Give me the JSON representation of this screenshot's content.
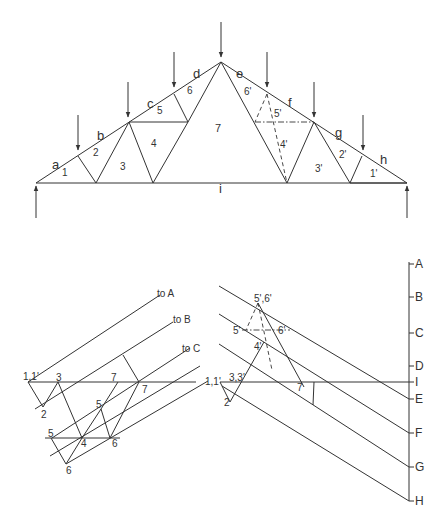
{
  "diagram": {
    "colors": {
      "line": "#333333",
      "background": "#ffffff"
    },
    "truss": {
      "lines": [
        [
          36,
          183,
          221,
          62
        ],
        [
          221,
          62,
          407,
          183
        ],
        [
          36,
          183,
          407,
          183
        ],
        [
          78,
          156,
          96,
          183
        ],
        [
          96,
          183,
          129,
          122
        ],
        [
          129,
          122,
          153,
          183
        ],
        [
          129,
          122,
          188,
          122
        ],
        [
          153,
          183,
          188,
          122
        ],
        [
          174,
          94,
          188,
          122
        ],
        [
          188,
          122,
          221,
          62
        ],
        [
          221,
          62,
          287,
          183
        ],
        [
          287,
          183,
          314,
          122
        ],
        [
          314,
          122,
          350,
          183
        ],
        [
          350,
          183,
          362,
          156
        ],
        [
          350,
          183,
          407,
          183
        ]
      ],
      "dashed": [
        [
          267,
          94,
          255,
          122
        ],
        [
          267,
          94,
          287,
          183
        ]
      ],
      "dashdot": [
        [
          255,
          122,
          314,
          122
        ]
      ],
      "loads": [
        {
          "x": 36,
          "y1": 218,
          "y2": 186,
          "dir": "up"
        },
        {
          "x": 407,
          "y1": 218,
          "y2": 186,
          "dir": "up"
        },
        {
          "x": 78,
          "y1": 115,
          "y2": 150,
          "dir": "down"
        },
        {
          "x": 128,
          "y1": 82,
          "y2": 117,
          "dir": "down"
        },
        {
          "x": 174,
          "y1": 52,
          "y2": 87,
          "dir": "down"
        },
        {
          "x": 221,
          "y1": 22,
          "y2": 57,
          "dir": "down"
        },
        {
          "x": 267,
          "y1": 52,
          "y2": 87,
          "dir": "down"
        },
        {
          "x": 314,
          "y1": 82,
          "y2": 117,
          "dir": "down"
        },
        {
          "x": 363,
          "y1": 115,
          "y2": 150,
          "dir": "down"
        }
      ],
      "labels": [
        {
          "t": "a",
          "x": 52,
          "y": 169,
          "s": 13
        },
        {
          "t": "b",
          "x": 97,
          "y": 140,
          "s": 13
        },
        {
          "t": "c",
          "x": 147,
          "y": 108,
          "s": 13
        },
        {
          "t": "d",
          "x": 193,
          "y": 78,
          "s": 13
        },
        {
          "t": "e",
          "x": 236,
          "y": 78,
          "s": 13
        },
        {
          "t": "f",
          "x": 288,
          "y": 107,
          "s": 13
        },
        {
          "t": "g",
          "x": 335,
          "y": 137,
          "s": 13
        },
        {
          "t": "h",
          "x": 380,
          "y": 164,
          "s": 13
        },
        {
          "t": "i",
          "x": 219,
          "y": 193,
          "s": 13
        },
        {
          "t": "1",
          "x": 62,
          "y": 176,
          "s": 10
        },
        {
          "t": "2",
          "x": 93,
          "y": 156,
          "s": 10
        },
        {
          "t": "3",
          "x": 120,
          "y": 170,
          "s": 10
        },
        {
          "t": "4",
          "x": 151,
          "y": 147,
          "s": 10
        },
        {
          "t": "5",
          "x": 157,
          "y": 114,
          "s": 10
        },
        {
          "t": "6",
          "x": 187,
          "y": 94,
          "s": 10
        },
        {
          "t": "7",
          "x": 215,
          "y": 132,
          "s": 11
        },
        {
          "t": "6'",
          "x": 244,
          "y": 95,
          "s": 10
        },
        {
          "t": "5'",
          "x": 274,
          "y": 117,
          "s": 10
        },
        {
          "t": "4'",
          "x": 280,
          "y": 148,
          "s": 10
        },
        {
          "t": "3'",
          "x": 315,
          "y": 172,
          "s": 10
        },
        {
          "t": "2'",
          "x": 339,
          "y": 158,
          "s": 10
        },
        {
          "t": "1'",
          "x": 370,
          "y": 177,
          "s": 10
        }
      ]
    },
    "force_left": {
      "lines": [
        [
          28,
          382,
          160,
          295
        ],
        [
          35,
          409,
          173,
          322
        ],
        [
          52,
          438,
          190,
          348
        ],
        [
          50,
          456,
          200,
          366
        ],
        [
          66,
          464,
          208,
          381
        ],
        [
          28,
          382,
          196,
          382
        ],
        [
          45,
          438,
          120,
          438
        ],
        [
          28,
          382,
          43,
          407
        ],
        [
          43,
          407,
          58,
          382
        ],
        [
          58,
          382,
          82,
          438
        ],
        [
          82,
          438,
          101,
          409
        ],
        [
          101,
          409,
          110,
          438
        ],
        [
          110,
          438,
          139,
          382
        ],
        [
          123,
          355,
          139,
          382
        ],
        [
          101,
          409,
          118,
          382
        ],
        [
          66,
          464,
          51,
          438
        ],
        [
          66,
          464,
          82,
          438
        ]
      ],
      "labels": [
        {
          "t": "to A",
          "x": 157,
          "y": 297,
          "s": 10
        },
        {
          "t": "to B",
          "x": 173,
          "y": 323,
          "s": 10
        },
        {
          "t": "to C",
          "x": 182,
          "y": 352,
          "s": 10
        },
        {
          "t": "1,1'",
          "x": 23,
          "y": 380,
          "s": 10
        },
        {
          "t": "3",
          "x": 56,
          "y": 381,
          "s": 10
        },
        {
          "t": "7",
          "x": 111,
          "y": 381,
          "s": 10
        },
        {
          "t": "7",
          "x": 142,
          "y": 393,
          "s": 10
        },
        {
          "t": "2",
          "x": 41,
          "y": 418,
          "s": 10
        },
        {
          "t": "5",
          "x": 96,
          "y": 408,
          "s": 10
        },
        {
          "t": "5",
          "x": 48,
          "y": 437,
          "s": 10
        },
        {
          "t": "4",
          "x": 81,
          "y": 447,
          "s": 10
        },
        {
          "t": "6",
          "x": 112,
          "y": 447,
          "s": 10
        },
        {
          "t": "6",
          "x": 66,
          "y": 474,
          "s": 10
        }
      ]
    },
    "force_right": {
      "lines": [
        [
          219,
          286,
          409,
          399
        ],
        [
          219,
          314,
          409,
          433
        ],
        [
          219,
          344,
          409,
          467
        ],
        [
          222,
          386,
          409,
          501
        ],
        [
          220,
          382,
          409,
          382
        ],
        [
          409,
          262,
          409,
          501
        ],
        [
          220,
          382,
          230,
          402
        ],
        [
          230,
          402,
          264,
          342
        ],
        [
          258,
          303,
          304,
          387
        ],
        [
          314,
          382,
          313,
          405
        ]
      ],
      "dashed": [
        [
          258,
          303,
          246,
          330
        ],
        [
          258,
          303,
          272,
          370
        ]
      ],
      "dashdot": [
        [
          242,
          330,
          290,
          330
        ]
      ],
      "ticks": [
        {
          "t": "A",
          "y": 264
        },
        {
          "t": "B",
          "y": 297
        },
        {
          "t": "C",
          "y": 333
        },
        {
          "t": "D",
          "y": 366
        },
        {
          "t": "I",
          "y": 382
        },
        {
          "t": "E",
          "y": 399
        },
        {
          "t": "F",
          "y": 433
        },
        {
          "t": "G",
          "y": 467
        },
        {
          "t": "H",
          "y": 501
        }
      ],
      "labels": [
        {
          "t": "5',6'",
          "x": 254,
          "y": 302,
          "s": 10
        },
        {
          "t": "5'",
          "x": 233,
          "y": 334,
          "s": 10
        },
        {
          "t": "6'",
          "x": 278,
          "y": 334,
          "s": 10
        },
        {
          "t": "4'",
          "x": 254,
          "y": 350,
          "s": 10
        },
        {
          "t": "1,1'",
          "x": 205,
          "y": 385,
          "s": 10
        },
        {
          "t": "3,3'",
          "x": 229,
          "y": 381,
          "s": 10
        },
        {
          "t": "7",
          "x": 297,
          "y": 391,
          "s": 10
        },
        {
          "t": "2",
          "x": 224,
          "y": 406,
          "s": 10
        }
      ]
    }
  }
}
